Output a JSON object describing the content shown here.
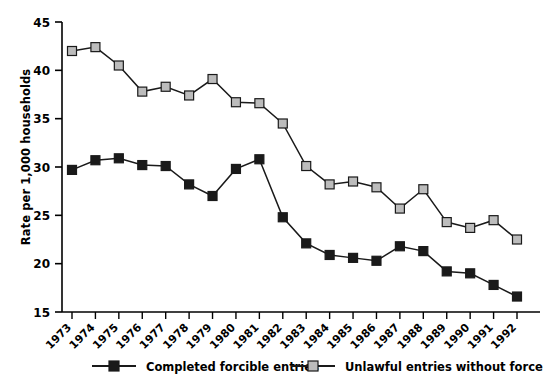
{
  "chart_data": {
    "type": "line",
    "title": "",
    "xlabel": "",
    "ylabel": "Rate per 1,000 households",
    "ylim": [
      15,
      45
    ],
    "yticks": [
      15,
      20,
      25,
      30,
      35,
      40,
      45
    ],
    "grid": false,
    "legend_position": "bottom",
    "categories": [
      "1973",
      "1974",
      "1975",
      "1976",
      "1977",
      "1978",
      "1979",
      "1980",
      "1981",
      "1982",
      "1983",
      "1984",
      "1985",
      "1986",
      "1987",
      "1988",
      "1989",
      "1990",
      "1991",
      "1992"
    ],
    "series": [
      {
        "name": "Completed forcible entries",
        "marker": "square",
        "color": "#1a1a1a",
        "values": [
          29.7,
          30.7,
          30.9,
          30.2,
          30.1,
          28.2,
          27.0,
          29.8,
          30.8,
          24.8,
          22.1,
          20.9,
          20.6,
          20.3,
          21.8,
          21.3,
          19.2,
          19.0,
          17.8,
          16.6
        ]
      },
      {
        "name": "Unlawful entries without force",
        "marker": "square",
        "color": "#bcbcbc",
        "values": [
          42.0,
          42.4,
          40.5,
          37.8,
          38.3,
          37.4,
          39.1,
          36.7,
          36.6,
          34.5,
          30.1,
          28.2,
          28.5,
          27.9,
          25.7,
          27.7,
          24.3,
          23.7,
          24.5,
          22.5
        ]
      }
    ]
  },
  "legend": {
    "items": [
      {
        "label": "Completed forcible entries",
        "color": "#1a1a1a"
      },
      {
        "label": "Unlawful entries without force",
        "color": "#bcbcbc"
      }
    ]
  }
}
